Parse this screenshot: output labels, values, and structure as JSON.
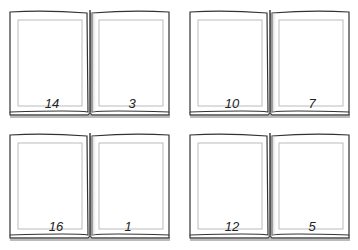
{
  "spreads": [
    {
      "left_page": "14",
      "right_page": "3"
    },
    {
      "left_page": "10",
      "right_page": "7"
    },
    {
      "left_page": "16",
      "right_page": "1"
    },
    {
      "left_page": "12",
      "right_page": "5"
    }
  ],
  "colors": {
    "page_border": "#333333",
    "inner_frame": "#bbbbbb",
    "spine_shadow": "#888888",
    "background": "#ffffff"
  }
}
